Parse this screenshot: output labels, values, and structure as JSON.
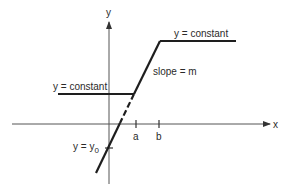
{
  "diagram": {
    "type": "piecewise-linear-function",
    "axes": {
      "x_label": "x",
      "y_label": "y"
    },
    "ticks": {
      "a_label": "a",
      "b_label": "b"
    },
    "annotations": {
      "upper_constant": "y = constant",
      "lower_constant": "y = constant",
      "slope": "slope = m",
      "intercept_prefix": "y = y",
      "intercept_sub": "0"
    },
    "segments": [
      {
        "name": "lower-constant",
        "style": "solid",
        "description": "horizontal line y = constant for x < a"
      },
      {
        "name": "sloped-segment",
        "style": "solid",
        "description": "line of slope m between a and b"
      },
      {
        "name": "upper-constant",
        "style": "solid",
        "description": "horizontal line y = constant for x > b"
      },
      {
        "name": "extrapolation",
        "style": "dashed then solid",
        "description": "extension of sloped line crossing y-axis at y0"
      }
    ],
    "colors": {
      "line": "#1e1e1e",
      "axis": "#555555",
      "text": "#2a2a2a",
      "background": "#ffffff"
    }
  }
}
